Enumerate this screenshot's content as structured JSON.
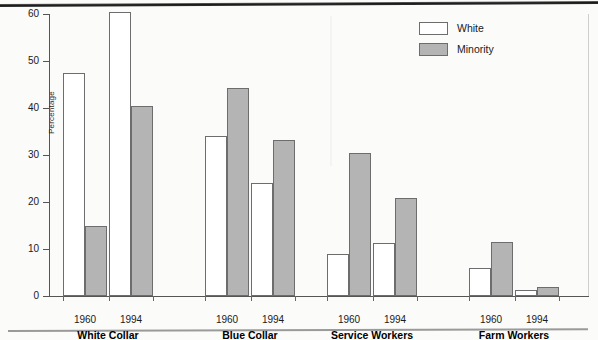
{
  "chart_data": {
    "type": "bar",
    "title": "",
    "xlabel": "",
    "ylabel": "Percentage",
    "ylim": [
      0,
      60
    ],
    "yticks": [
      0,
      10,
      20,
      30,
      40,
      50,
      60
    ],
    "grid": false,
    "legend_position": "top-right",
    "categories": [
      "1960",
      "1994",
      "1960",
      "1994",
      "1960",
      "1994",
      "1960",
      "1994"
    ],
    "groups": [
      {
        "name": "White Collar",
        "years": [
          "1960",
          "1994"
        ],
        "bars": [
          {
            "year": "1960",
            "series": "White",
            "value": 47.5
          },
          {
            "year": "1960",
            "series": "Minority",
            "value": 15.0
          },
          {
            "year": "1994",
            "series": "White",
            "value": 60.5
          },
          {
            "year": "1994",
            "series": "Minority",
            "value": 40.5
          }
        ]
      },
      {
        "name": "Blue Collar",
        "years": [
          "1960",
          "1994"
        ],
        "bars": [
          {
            "year": "1960",
            "series": "White",
            "value": 34.0
          },
          {
            "year": "1960",
            "series": "Minority",
            "value": 44.2
          },
          {
            "year": "1994",
            "series": "White",
            "value": 24.0
          },
          {
            "year": "1994",
            "series": "Minority",
            "value": 33.3
          }
        ]
      },
      {
        "name": "Service Workers",
        "years": [
          "1960",
          "1994"
        ],
        "bars": [
          {
            "year": "1960",
            "series": "White",
            "value": 9.0
          },
          {
            "year": "1960",
            "series": "Minority",
            "value": 30.4
          },
          {
            "year": "1994",
            "series": "White",
            "value": 11.3
          },
          {
            "year": "1994",
            "series": "Minority",
            "value": 20.9
          }
        ]
      },
      {
        "name": "Farm Workers",
        "years": [
          "1960",
          "1994"
        ],
        "bars": [
          {
            "year": "1960",
            "series": "White",
            "value": 6.0
          },
          {
            "year": "1960",
            "series": "Minority",
            "value": 11.4
          },
          {
            "year": "1994",
            "series": "White",
            "value": 1.3
          },
          {
            "year": "1994",
            "series": "Minority",
            "value": 2.0
          }
        ]
      }
    ],
    "series": [
      {
        "name": "White",
        "color": "#ffffff",
        "values": [
          47.5,
          60.5,
          34.0,
          24.0,
          9.0,
          11.3,
          6.0,
          1.3
        ]
      },
      {
        "name": "Minority",
        "color": "#b4b4b4",
        "values": [
          15.0,
          40.5,
          44.2,
          33.3,
          30.4,
          20.9,
          11.4,
          2.0
        ]
      }
    ]
  },
  "axis": {
    "y_title": "Percentage",
    "y_tick_labels": [
      "0",
      "10",
      "20",
      "30",
      "40",
      "50",
      "60"
    ]
  },
  "legend": {
    "items": [
      {
        "label": "White",
        "swatch": "white"
      },
      {
        "label": "Minority",
        "swatch": "minority"
      }
    ]
  },
  "colors": {
    "white_series": "#ffffff",
    "minority_series": "#b4b4b4",
    "bar_outline": "#6d6d6d",
    "axis": "#555555",
    "text": "#1a1a1a"
  }
}
